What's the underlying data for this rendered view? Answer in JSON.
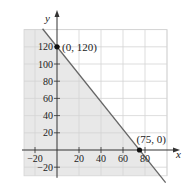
{
  "chart_data": {
    "type": "line",
    "title": "",
    "xlabel": "x",
    "ylabel": "y",
    "xlim": [
      -30,
      100
    ],
    "ylim": [
      -30,
      140
    ],
    "grid": true,
    "x_ticks": [
      -20,
      20,
      40,
      60,
      80
    ],
    "y_ticks": [
      -20,
      20,
      40,
      60,
      80,
      100,
      120
    ],
    "series": [
      {
        "name": "boundary line",
        "equation": "8x + 5y = 600",
        "x": [
          -20,
          0,
          75,
          100
        ],
        "y": [
          152,
          120,
          0,
          -40
        ]
      }
    ],
    "shaded_region": "below-left of the line (8x + 5y <= 600)",
    "points": [
      {
        "label": "(0, 120)",
        "x": 0,
        "y": 120
      },
      {
        "label": "(75, 0)",
        "x": 75,
        "y": 0
      }
    ],
    "colors": {
      "shade": "#e8e8e8",
      "grid": "#d4d4d4",
      "axis": "#333333",
      "line": "#666666",
      "point": "#111111"
    }
  }
}
